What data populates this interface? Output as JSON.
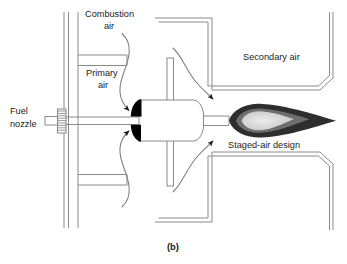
{
  "figure": {
    "caption": "(b)",
    "background": "#ffffff",
    "line_color": "#8a8a8a",
    "text_color": "#222222"
  },
  "labels": {
    "combustion_air_line1": "Combustion",
    "combustion_air_line2": "air",
    "primary_air_line1": "Primary",
    "primary_air_line2": "air",
    "fuel_nozzle_line1": "Fuel",
    "fuel_nozzle_line2": "nozzle",
    "secondary_air": "Secondary air",
    "staged_air_design": "Staged-air design"
  },
  "components": {
    "fuel_nozzle": "fuel-nozzle-hatched-flange",
    "fuel_tube": "fuel-tube",
    "swirler_vanes": "swirler-black-vanes",
    "burner_cone": "burner-cone",
    "support_plate": "vertical-support-plate",
    "plenum_wall": "left-plenum-wall",
    "primary_air_shelf_upper": "primary-air-shelf-upper",
    "primary_air_shelf_lower": "primary-air-shelf-lower",
    "secondary_duct_upper": "secondary-air-duct-upper",
    "secondary_duct_lower": "secondary-air-duct-lower",
    "flame": "flame-teardrop"
  },
  "flow_arrows": {
    "combustion_air_upper": "combustion-air-flow-upper",
    "combustion_air_lower": "combustion-air-flow-lower",
    "secondary_air_upper": "secondary-air-flow-upper",
    "secondary_air_lower": "secondary-air-flow-lower"
  },
  "colors": {
    "flame_outer": "#2e2e2e",
    "flame_mid": "#6e6e6e",
    "flame_core": "#d8d8d8",
    "vane_fill": "#000000",
    "stroke": "#8a8a8a"
  }
}
